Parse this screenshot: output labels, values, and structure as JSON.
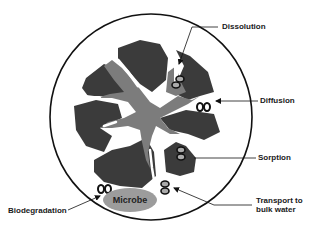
{
  "diagram": {
    "type": "soil particle contaminant fate processes",
    "colors": {
      "particle_dark": "#3b3b3b",
      "organic_gray": "#7c7c7c",
      "microbe": "#9c9c9c",
      "outline": "#111111",
      "background": "#ffffff"
    },
    "labels": {
      "dissolution": "Dissolution",
      "diffusion": "Diffusion",
      "sorption": "Sorption",
      "transport_line1": "Transport to",
      "transport_line2": "bulk water",
      "biodegradation": "Biodegradation",
      "microbe": "Microbe"
    },
    "icons": {
      "contaminant_molecule": "double-ellipse-molecule-icon"
    }
  }
}
